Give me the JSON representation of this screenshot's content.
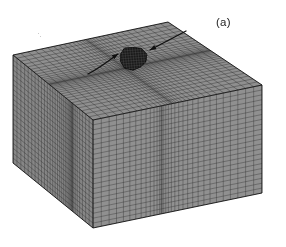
{
  "figure": {
    "subfigure_label": "(a)",
    "caption_text": "",
    "background_color": "#ffffff"
  },
  "geometry": {
    "description": "three-dimensional finite element mesh of a rectangular block with embedded spherical inclusion",
    "projection": "axonometric",
    "top_face": {
      "left_corner": [
        13,
        55
      ],
      "back_corner": [
        168,
        22
      ],
      "right_corner": [
        262,
        85
      ],
      "front_corner": [
        93,
        120
      ]
    },
    "front_left_face": {
      "top_left": [
        13,
        55
      ],
      "top_right": [
        93,
        120
      ],
      "bottom_right": [
        93,
        228
      ],
      "bottom_left": [
        13,
        163
      ]
    },
    "front_right_face": {
      "top_left": [
        93,
        120
      ],
      "top_right": [
        262,
        85
      ],
      "bottom_right": [
        262,
        176
      ],
      "bottom_left": [
        93,
        228
      ]
    },
    "depth_px": 108
  },
  "mesh": {
    "face_fill_color": "#8f8f8f",
    "line_color": "#2b2b2b",
    "line_width": 0.45,
    "top_u_divisions": 34,
    "top_v_divisions": 34,
    "side_vertical_divisions": 34,
    "side_layer_divisions": 22,
    "grading": "refined toward inclusion, coarse at outer boundary",
    "refinement_center_u": 0.47,
    "refinement_center_v": 0.45,
    "refinement_strength": 0.62
  },
  "inclusion": {
    "label": "spherical inclusion",
    "center": [
      133,
      58
    ],
    "radius_x": 14,
    "radius_y": 12,
    "fill_color": "#1a1a1a",
    "edge_color": "#000000",
    "facet_count": 10,
    "mesh_visible": true
  },
  "annotations": {
    "arrows": [
      {
        "name": "left-arrow",
        "start": [
          88,
          74
        ],
        "end": [
          118,
          54
        ],
        "head_angle_deg": -33,
        "color": "#101010",
        "curved": true
      },
      {
        "name": "right-arrow",
        "start": [
          186,
          31
        ],
        "end": [
          150,
          50
        ],
        "head_angle_deg": 152,
        "color": "#101010",
        "curved": false
      }
    ]
  },
  "artifacts": {
    "specks": [
      {
        "x": 38,
        "y": 33,
        "size": 1.4
      },
      {
        "x": 40,
        "y": 36,
        "size": 1.0
      }
    ]
  }
}
